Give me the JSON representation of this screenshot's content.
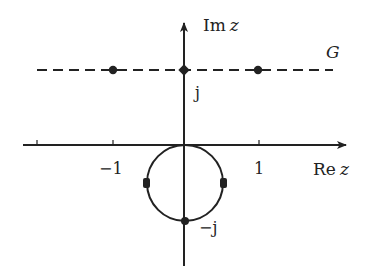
{
  "diagram": {
    "type": "complex-plane",
    "axes": {
      "real_label_prefix": "Re",
      "imag_label_prefix": "Im",
      "var": "z",
      "ticks": [
        {
          "value": -1,
          "label": "−1"
        },
        {
          "value": 1,
          "label": "1"
        }
      ]
    },
    "line": {
      "label": "G",
      "style": "dashed",
      "im_value": 1,
      "points": [
        {
          "re": -1,
          "im": 1
        },
        {
          "re": 0,
          "im": 1,
          "label": "j"
        },
        {
          "re": 1,
          "im": 1
        }
      ]
    },
    "circle": {
      "style": "solid",
      "points": [
        {
          "label": "top",
          "on": "origin"
        },
        {
          "label": "left"
        },
        {
          "label": "right"
        },
        {
          "label": "−j"
        }
      ]
    },
    "labels": {
      "j": "j",
      "minus_j": "−j",
      "G": "G",
      "minus_one": "−1",
      "one": "1"
    },
    "colors": {
      "stroke": "#222222",
      "background": "#ffffff"
    }
  }
}
